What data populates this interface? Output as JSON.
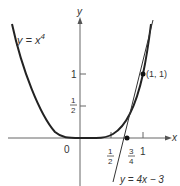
{
  "figure": {
    "curve_label": "y = x",
    "curve_exponent": "4",
    "tangent_label": "y = 4x − 3",
    "point_label": "(1, 1)",
    "axis_x_label": "x",
    "axis_y_label": "y",
    "origin_label": "0",
    "x_ticks": [
      {
        "num": "1",
        "den": "2"
      },
      {
        "num": "3",
        "den": "4"
      },
      {
        "label": "1"
      }
    ],
    "y_ticks": [
      {
        "label": "1"
      },
      {
        "num": "1",
        "den": "2"
      }
    ],
    "colors": {
      "curve": "#222222",
      "axes": "#555555"
    }
  }
}
